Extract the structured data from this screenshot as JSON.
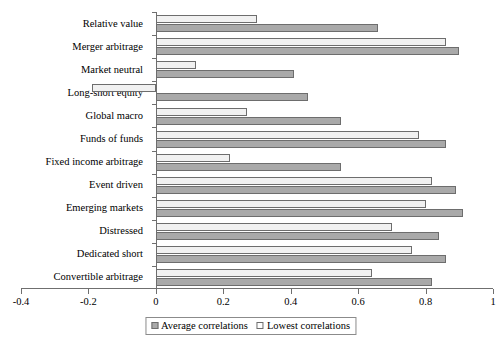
{
  "chart_data": {
    "type": "bar",
    "orientation": "horizontal",
    "title": "",
    "xlabel": "",
    "ylabel": "",
    "xlim": [
      -0.4,
      1
    ],
    "xticks": [
      -0.4,
      -0.2,
      0,
      0.2,
      0.4,
      0.6,
      0.8,
      1
    ],
    "xtick_labels": [
      "-0.4",
      "-0.2",
      "0",
      "0.2",
      "0.4",
      "0.6",
      "0.8",
      "1"
    ],
    "grid": false,
    "legend_position": "bottom-center",
    "categories": [
      "Relative value",
      "Merger arbitrage",
      "Market neutral",
      "Long-short equity",
      "Global macro",
      "Funds of funds",
      "Fixed income arbitrage",
      "Event driven",
      "Emerging markets",
      "Distressed",
      "Dedicated short",
      "Convertible arbitrage"
    ],
    "series": [
      {
        "name": "Average correlations",
        "color": "#a9a9a9",
        "values": [
          0.66,
          0.9,
          0.41,
          0.45,
          0.55,
          0.86,
          0.55,
          0.89,
          0.91,
          0.84,
          0.86,
          0.82
        ]
      },
      {
        "name": "Lowest correlations",
        "color": "#f1f1f1",
        "values": [
          0.3,
          0.86,
          0.12,
          -0.19,
          0.27,
          0.78,
          0.22,
          0.82,
          0.8,
          0.7,
          0.76,
          0.64
        ]
      }
    ]
  },
  "legend": {
    "items": [
      {
        "label": "Average correlations",
        "swatch": "avg-swatch-icon"
      },
      {
        "label": "Lowest correlations",
        "swatch": "low-swatch-icon"
      }
    ]
  }
}
